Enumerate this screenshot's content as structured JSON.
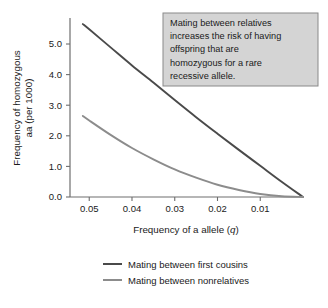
{
  "chart_data": {
    "type": "line",
    "title": "",
    "xlabel": "Frequency of a allele (q)",
    "ylabel": "Frequency of homozygous aa (per 1000)",
    "ylabel_line1": "Frequency of homozygous",
    "ylabel_line2": "aa (per 1000)",
    "xlabel_prefix": "Frequency of a allele (",
    "xlabel_italic": "q",
    "xlabel_suffix": ")",
    "x_ticks": [
      "0.05",
      "0.04",
      "0.03",
      "0.02",
      "0.01"
    ],
    "x_tick_values": [
      0.05,
      0.04,
      0.03,
      0.02,
      0.01
    ],
    "y_ticks": [
      "0.0",
      "1.0",
      "2.0",
      "3.0",
      "4.0",
      "5.0"
    ],
    "y_tick_values": [
      0.0,
      1.0,
      2.0,
      3.0,
      4.0,
      5.0
    ],
    "xlim": [
      0.0545,
      0.0
    ],
    "ylim": [
      0.0,
      5.85
    ],
    "x_reversed": true,
    "grid": false,
    "legend_position": "below",
    "x": [
      0.0515,
      0.05,
      0.045,
      0.04,
      0.035,
      0.03,
      0.025,
      0.02,
      0.015,
      0.01,
      0.005,
      0.0
    ],
    "series": [
      {
        "name": "Mating between first cousins",
        "color": "#4a4a4a",
        "values": [
          5.65,
          5.48,
          4.89,
          4.3,
          3.74,
          3.17,
          2.61,
          2.07,
          1.54,
          1.02,
          0.5,
          0.0
        ]
      },
      {
        "name": "Mating between nonrelatives",
        "color": "#8c8c8c",
        "values": [
          2.65,
          2.5,
          2.03,
          1.6,
          1.23,
          0.9,
          0.63,
          0.4,
          0.23,
          0.1,
          0.025,
          0.0
        ]
      }
    ],
    "annotation": {
      "lines": [
        "Mating between relatives",
        "increases the risk of having",
        "offspring that are",
        "homozygous for a rare",
        "recessive allele."
      ],
      "fill": "#d4d4d4",
      "border": "#8a8a8a"
    }
  },
  "legend": {
    "items": [
      {
        "label": "Mating between first cousins",
        "color": "#4a4a4a"
      },
      {
        "label": "Mating between nonrelatives",
        "color": "#8c8c8c"
      }
    ]
  },
  "colors": {
    "background": "#ffffff",
    "axis": "#6e6e6e",
    "text": "#1a1a1a"
  }
}
